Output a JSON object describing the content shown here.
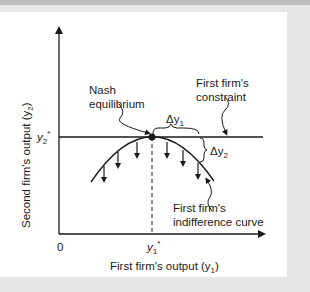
{
  "figure": {
    "x_axis": {
      "label": "First firm's output (y",
      "label_sub": "1",
      "label_close": ")",
      "origin": "0",
      "tick": "y",
      "tick_sub": "1",
      "tick_sup": "*"
    },
    "y_axis": {
      "label": "Second firm's output (y",
      "label_sub": "2",
      "label_close": ")",
      "tick": "y",
      "tick_sub": "2",
      "tick_sup": "*"
    },
    "annotations": {
      "nash_line1": "Nash",
      "nash_line2": "equilibrium",
      "constraint_line1": "First firm's",
      "constraint_line2": "constraint",
      "indiff_line1": "First firm's",
      "indiff_line2": "indifference curve",
      "delta_y1": "Δy",
      "delta_y1_sub": "1",
      "delta_y2": "Δy",
      "delta_y2_sub": "2"
    },
    "colors": {
      "ink": "#1a1a1a",
      "background": "#ffffff",
      "frame": "#e6e6e6"
    }
  }
}
